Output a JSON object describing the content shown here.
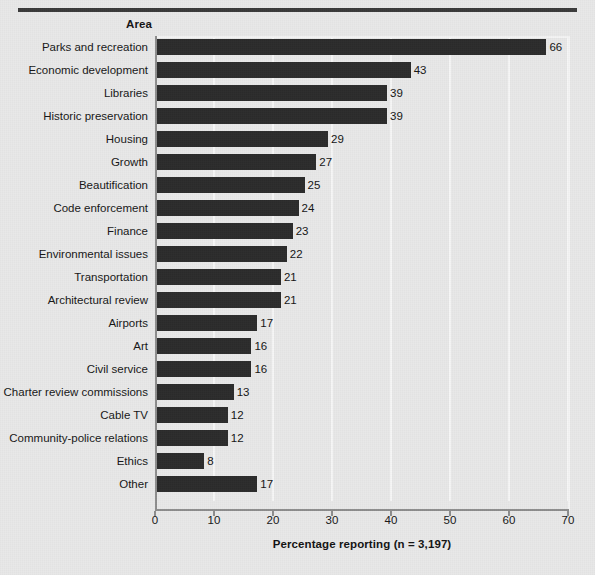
{
  "chart_data": {
    "type": "bar",
    "orientation": "horizontal",
    "title": "",
    "xlabel": "Percentage reporting (n = 3,197)",
    "ylabel": "Area",
    "xlim": [
      0,
      70
    ],
    "xticks": [
      0,
      10,
      20,
      30,
      40,
      50,
      60,
      70
    ],
    "grid": true,
    "grid_axis": "x",
    "legend": "none",
    "bar_color": "#2b2b2b",
    "background_color": "#e8e8e8",
    "categories": [
      "Parks and recreation",
      "Economic development",
      "Libraries",
      "Historic preservation",
      "Housing",
      "Growth",
      "Beautification",
      "Code enforcement",
      "Finance",
      "Environmental issues",
      "Transportation",
      "Architectural review",
      "Airports",
      "Art",
      "Civil service",
      "Charter review commissions",
      "Cable TV",
      "Community-police relations",
      "Ethics",
      "Other"
    ],
    "values": [
      66,
      43,
      39,
      39,
      29,
      27,
      25,
      24,
      23,
      22,
      21,
      21,
      17,
      16,
      16,
      13,
      12,
      12,
      8,
      17
    ],
    "value_labels": [
      "66",
      "43",
      "39",
      "39",
      "29",
      "27",
      "25",
      "24",
      "23",
      "22",
      "21",
      "21",
      "17",
      "16",
      "16",
      "13",
      "12",
      "12",
      "8",
      "17"
    ]
  },
  "axis": {
    "column_header": "Area",
    "x_label": "Percentage reporting (n = 3,197)",
    "tick_labels": [
      "0",
      "10",
      "20",
      "30",
      "40",
      "50",
      "60",
      "70"
    ]
  }
}
